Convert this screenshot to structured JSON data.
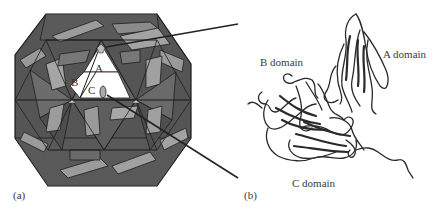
{
  "figure": {
    "panel_a": {
      "label": "(a)",
      "description": "icosahedral virus capsid diagram",
      "subunit_labels": {
        "a": "A",
        "b": "B",
        "c": "C"
      },
      "colors": {
        "dark": "#4a4a4a",
        "mid": "#6b6b6b",
        "light": "#9a9a9a",
        "highlight": "#ffffff",
        "outline": "#1a1a1a"
      }
    },
    "panel_b": {
      "label": "(b)",
      "description": "ribbon structure of capsid protein",
      "domain_labels": {
        "a": "A domain",
        "b": "B domain",
        "c": "C domain"
      }
    }
  }
}
